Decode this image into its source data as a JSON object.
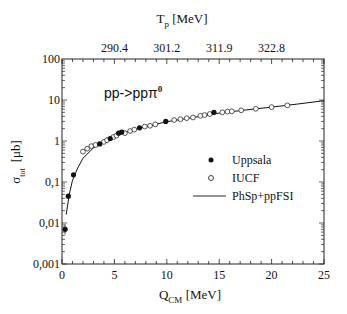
{
  "chart_data": {
    "type": "scatter",
    "title": "",
    "annotation": "pp->ppπ⁰",
    "annotation_parts": {
      "main": "pp->ppπ",
      "sup": "0"
    },
    "xlabel": {
      "main": "Q",
      "sub": "CM",
      "unit": " [MeV]"
    },
    "ylabel": {
      "main": "σ",
      "sub": "tot",
      "unit": "[μb]"
    },
    "top_xlabel": {
      "main": "T",
      "sub": "p",
      "unit": " [MeV]"
    },
    "xlim": [
      0,
      25
    ],
    "ylim": [
      0.001,
      100
    ],
    "yscale": "log",
    "x_ticks": [
      0,
      5,
      10,
      15,
      20,
      25
    ],
    "x_tick_labels": [
      "0",
      "5",
      "10",
      "15",
      "20",
      "25"
    ],
    "y_ticks": [
      0.001,
      0.01,
      0.1,
      1,
      10,
      100
    ],
    "y_tick_labels": [
      "0,001",
      "0,01",
      "0,1",
      "1",
      "10",
      "100"
    ],
    "top_ticks_q": [
      5,
      10,
      15,
      20
    ],
    "top_tick_labels": [
      "290.4",
      "301.2",
      "311.9",
      "322.8"
    ],
    "grid": false,
    "legend_position": "center-right",
    "legend": [
      {
        "label": "Uppsala",
        "marker": "filled-circle"
      },
      {
        "label": "IUCF",
        "marker": "open-circle"
      },
      {
        "label": "PhSp+ppFSI",
        "marker": "line"
      }
    ],
    "series": [
      {
        "name": "Uppsala",
        "marker": "filled-circle",
        "points": [
          [
            0.3,
            0.007
          ],
          [
            0.6,
            0.045
          ],
          [
            1.1,
            0.15
          ],
          [
            3.6,
            0.85
          ],
          [
            4.6,
            1.15
          ],
          [
            5.4,
            1.55
          ],
          [
            5.7,
            1.65
          ],
          [
            7.4,
            2.1
          ],
          [
            9.9,
            3.0
          ],
          [
            14.5,
            5.0
          ]
        ]
      },
      {
        "name": "IUCF",
        "marker": "open-circle",
        "points": [
          [
            2.0,
            0.55
          ],
          [
            2.4,
            0.65
          ],
          [
            2.8,
            0.75
          ],
          [
            3.2,
            0.8
          ],
          [
            4.0,
            0.95
          ],
          [
            4.3,
            1.05
          ],
          [
            4.9,
            1.25
          ],
          [
            5.2,
            1.35
          ],
          [
            6.0,
            1.55
          ],
          [
            6.5,
            1.75
          ],
          [
            6.9,
            1.9
          ],
          [
            7.9,
            2.25
          ],
          [
            8.4,
            2.35
          ],
          [
            8.9,
            2.55
          ],
          [
            10.7,
            3.25
          ],
          [
            11.3,
            3.4
          ],
          [
            11.9,
            3.6
          ],
          [
            12.5,
            3.75
          ],
          [
            13.2,
            4.1
          ],
          [
            13.6,
            4.3
          ],
          [
            14.1,
            4.55
          ],
          [
            15.3,
            5.0
          ],
          [
            15.8,
            5.2
          ],
          [
            16.2,
            5.3
          ],
          [
            17.1,
            5.6
          ],
          [
            18.5,
            6.1
          ],
          [
            20.0,
            6.7
          ],
          [
            21.5,
            7.4
          ]
        ]
      },
      {
        "name": "PhSp+ppFSI",
        "type": "line",
        "points": [
          [
            0.4,
            0.016
          ],
          [
            0.7,
            0.05
          ],
          [
            1.0,
            0.11
          ],
          [
            1.5,
            0.22
          ],
          [
            2.0,
            0.38
          ],
          [
            3.0,
            0.68
          ],
          [
            4.0,
            0.98
          ],
          [
            5.0,
            1.3
          ],
          [
            6.0,
            1.6
          ],
          [
            8.0,
            2.25
          ],
          [
            10.0,
            2.95
          ],
          [
            12.5,
            3.75
          ],
          [
            15.0,
            4.8
          ],
          [
            17.5,
            5.7
          ],
          [
            20.0,
            6.7
          ],
          [
            22.5,
            8.0
          ],
          [
            25.0,
            9.6
          ]
        ]
      }
    ]
  }
}
